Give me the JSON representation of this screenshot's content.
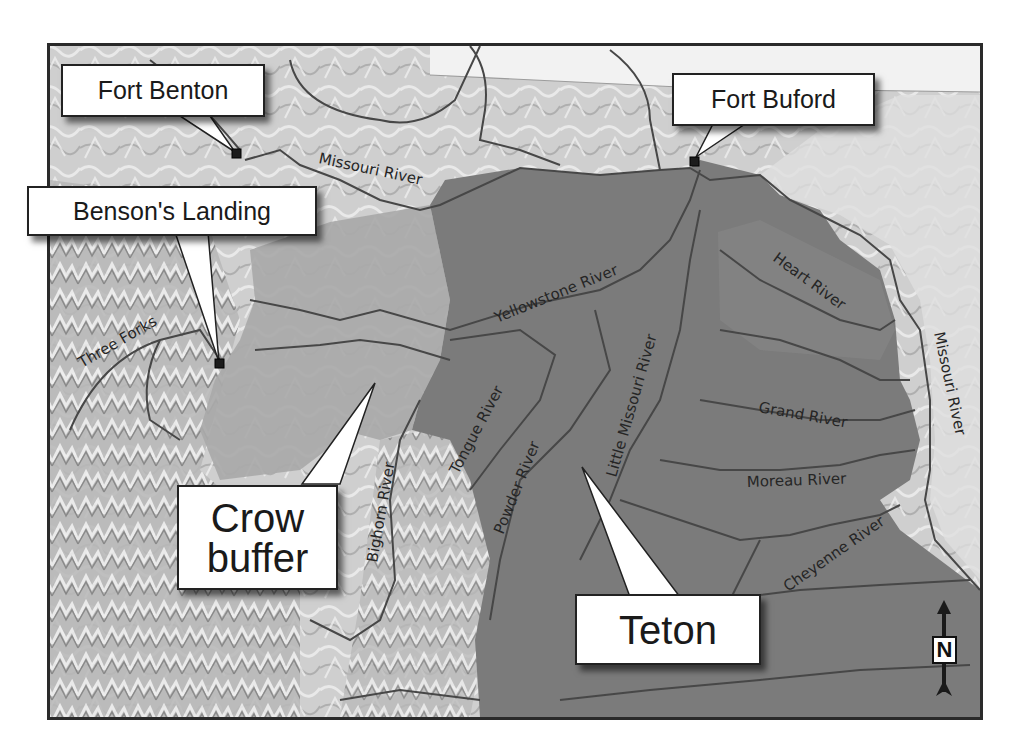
{
  "map": {
    "title": "",
    "colors": {
      "background_terrain": "#c9c9c9",
      "terrain_light": "#dcdcdc",
      "crow_buffer_fill": "#a8a8a8",
      "teton_fill": "#7a7a7a",
      "river_line": "#4a4a4a",
      "frame": "#2a2a2a"
    },
    "callouts": {
      "fort_benton": "Fort Benton",
      "fort_buford": "Fort Buford",
      "bensons_landing": "Benson's Landing",
      "crow_buffer_line1": "Crow",
      "crow_buffer_line2": "buffer",
      "teton": "Teton"
    },
    "rivers": {
      "missouri_upper": "Missouri River",
      "missouri_east": "Missouri River",
      "three_forks": "Three Forks",
      "yellowstone": "Yellowstone River",
      "tongue": "Tongue River",
      "powder": "Powder River",
      "little_missouri": "Little Missouri River",
      "bighorn": "Bighorn River",
      "heart": "Heart River",
      "grand": "Grand River",
      "moreau": "Moreau River",
      "cheyenne": "Cheyenne River"
    },
    "north_arrow": {
      "label": "N"
    },
    "regions": [
      {
        "name": "Crow buffer",
        "shade": "light gray"
      },
      {
        "name": "Teton",
        "shade": "dark gray"
      }
    ],
    "locations": [
      {
        "name": "Fort Benton",
        "type": "fort"
      },
      {
        "name": "Fort Buford",
        "type": "fort"
      },
      {
        "name": "Benson's Landing",
        "type": "landing"
      }
    ]
  }
}
